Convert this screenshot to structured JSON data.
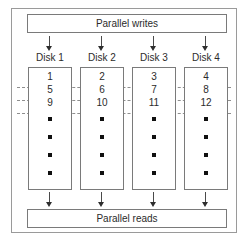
{
  "figure": {
    "colors": {
      "background": "#ffffff",
      "frame_border": "#9a9a9a",
      "box_border": "#7a7a7a",
      "stripe_line": "#8e8e8e",
      "text": "#2b2b2b",
      "bullet": "#101010",
      "arrow": "#2e2e2e"
    }
  },
  "top_box": {
    "label": "Parallel writes"
  },
  "bottom_box": {
    "label": "Parallel reads"
  },
  "disks": [
    {
      "label": "Disk 1",
      "blocks": [
        "1",
        "5",
        "9"
      ],
      "continuation_bullets": 4,
      "write_arrow": "down-arrow-icon",
      "read_arrow": "down-arrow-icon"
    },
    {
      "label": "Disk 2",
      "blocks": [
        "2",
        "6",
        "10"
      ],
      "continuation_bullets": 4,
      "write_arrow": "down-arrow-icon",
      "read_arrow": "down-arrow-icon"
    },
    {
      "label": "Disk 3",
      "blocks": [
        "3",
        "7",
        "11"
      ],
      "continuation_bullets": 4,
      "write_arrow": "down-arrow-icon",
      "read_arrow": "down-arrow-icon"
    },
    {
      "label": "Disk 4",
      "blocks": [
        "4",
        "8",
        "12"
      ],
      "continuation_bullets": 4,
      "write_arrow": "down-arrow-icon",
      "read_arrow": "down-arrow-icon"
    }
  ],
  "stripe_lines": [
    {
      "name": "stripe-boundary-1"
    },
    {
      "name": "stripe-boundary-2"
    },
    {
      "name": "stripe-boundary-3"
    }
  ]
}
